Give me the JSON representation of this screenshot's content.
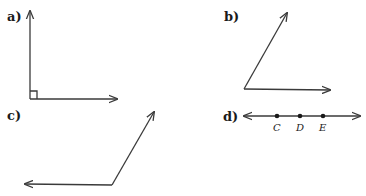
{
  "figures": {
    "a": {
      "label": "a)",
      "description": "right angle with square corner marker"
    },
    "b": {
      "label": "b)",
      "description": "acute angle"
    },
    "c": {
      "label": "c)",
      "description": "obtuse angle"
    },
    "d": {
      "label": "d)",
      "description": "line with three points",
      "points": [
        {
          "name": "C"
        },
        {
          "name": "D"
        },
        {
          "name": "E"
        }
      ]
    }
  },
  "colors": {
    "stroke": "#3a3a3a",
    "text": "#1a1a1a",
    "background": "#ffffff"
  }
}
